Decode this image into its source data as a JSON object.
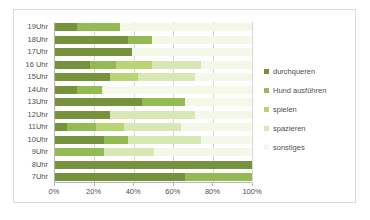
{
  "chart_data": {
    "type": "bar",
    "orientation": "horizontal",
    "stacked": "100%",
    "title": "",
    "xlabel": "",
    "ylabel": "",
    "xlim": [
      0,
      100
    ],
    "xticks": [
      "0%",
      "20%",
      "40%",
      "60%",
      "80%",
      "100%"
    ],
    "xtick_values": [
      0,
      20,
      40,
      60,
      80,
      100
    ],
    "grid": "vertical",
    "legend_position": "right",
    "categories": [
      "19Uhr",
      "18Uhr",
      "17Uhr",
      "16 Uhr",
      "15Uhr",
      "14Uhr",
      "13Uhr",
      "12Uhr",
      "11Uhr",
      "10Uhr",
      "9Uhr",
      "8Uhr",
      "7Uhr"
    ],
    "series": [
      {
        "name": "durchqueren",
        "color": "#76923c",
        "values": [
          11,
          37,
          39,
          18,
          28,
          11,
          44,
          28,
          6,
          25,
          0,
          100,
          66
        ]
      },
      {
        "name": "Hund ausführen",
        "color": "#94ba54",
        "values": [
          22,
          12,
          0,
          13,
          0,
          13,
          22,
          0,
          15,
          12,
          25,
          0,
          34
        ]
      },
      {
        "name": "spielen",
        "color": "#b8d473",
        "values": [
          0,
          0,
          0,
          18,
          14,
          0,
          0,
          0,
          14,
          0,
          0,
          0,
          0
        ]
      },
      {
        "name": "spazieren",
        "color": "#d8e8b4",
        "values": [
          0,
          0,
          0,
          25,
          29,
          0,
          0,
          43,
          29,
          37,
          25,
          0,
          0
        ]
      },
      {
        "name": "sonstiges",
        "color": "#f4f8e8",
        "values": [
          67,
          51,
          61,
          26,
          29,
          76,
          34,
          29,
          36,
          26,
          50,
          0,
          0
        ]
      }
    ]
  },
  "legend": {
    "items": [
      {
        "label": "durchqueren",
        "color": "#76923c"
      },
      {
        "label": "Hund ausführen",
        "color": "#94ba54"
      },
      {
        "label": "spielen",
        "color": "#b8d473"
      },
      {
        "label": "spazieren",
        "color": "#d8e8b4"
      },
      {
        "label": "sonstiges",
        "color": "#f4f8e8"
      }
    ]
  },
  "colors": {
    "frame_border": "#d9d9d9",
    "axis_line": "#b6b6b6",
    "gridline": "#d7d7d7",
    "text": "#4f4f4f",
    "background": "#ffffff"
  }
}
